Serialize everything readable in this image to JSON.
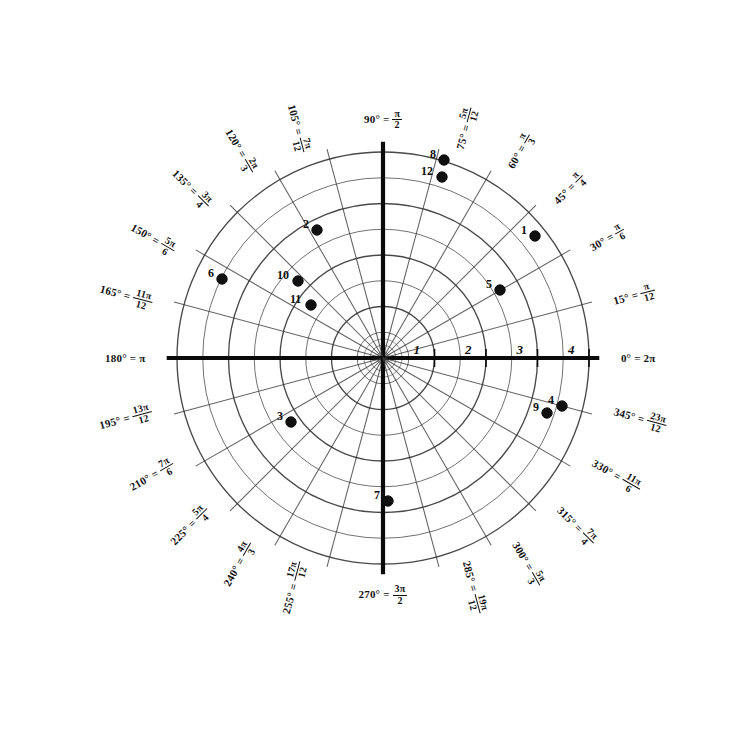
{
  "chart_data": {
    "type": "scatter",
    "title": "",
    "subtitle": "",
    "coordinate_system": "polar",
    "xlabel": "",
    "ylabel": "",
    "grid": true,
    "legend": "none",
    "center_px": [
      383,
      358
    ],
    "pixels_per_unit": 51.5,
    "radial_ticks": [
      "1",
      "2",
      "3",
      "4"
    ],
    "radial_tick_values": [
      1,
      2,
      3,
      4
    ],
    "radial_minor_rings": [
      0.5,
      1.5,
      2.5,
      3.5
    ],
    "rlim": [
      0,
      4.2
    ],
    "angular_step_deg": 15,
    "angular_labels": [
      {
        "deg": "0°",
        "rad_num": "",
        "rad_den": "",
        "rad_plain": "2π",
        "angle": 0,
        "rot": 0
      },
      {
        "deg": "15°",
        "rad_num": "π",
        "rad_den": "12",
        "rad_plain": "",
        "angle": 15,
        "rot": -15
      },
      {
        "deg": "30°",
        "rad_num": "π",
        "rad_den": "6",
        "rad_plain": "",
        "angle": 30,
        "rot": -30
      },
      {
        "deg": "45°",
        "rad_num": "π",
        "rad_den": "4",
        "rad_plain": "",
        "angle": 45,
        "rot": -45
      },
      {
        "deg": "60°",
        "rad_num": "π",
        "rad_den": "3",
        "rad_plain": "",
        "angle": 60,
        "rot": -60
      },
      {
        "deg": "75°",
        "rad_num": "5π",
        "rad_den": "12",
        "rad_plain": "",
        "angle": 75,
        "rot": -75
      },
      {
        "deg": "90°",
        "rad_num": "π",
        "rad_den": "2",
        "rad_plain": "",
        "angle": 90,
        "rot": 0
      },
      {
        "deg": "105°",
        "rad_num": "7π",
        "rad_den": "12",
        "rad_plain": "",
        "angle": 105,
        "rot": 75
      },
      {
        "deg": "120°",
        "rad_num": "2π",
        "rad_den": "3",
        "rad_plain": "",
        "angle": 120,
        "rot": 60
      },
      {
        "deg": "135°",
        "rad_num": "3π",
        "rad_den": "4",
        "rad_plain": "",
        "angle": 135,
        "rot": 45
      },
      {
        "deg": "150°",
        "rad_num": "5π",
        "rad_den": "6",
        "rad_plain": "",
        "angle": 150,
        "rot": 30
      },
      {
        "deg": "165°",
        "rad_num": "11π",
        "rad_den": "12",
        "rad_plain": "",
        "angle": 165,
        "rot": 15
      },
      {
        "deg": "180°",
        "rad_num": "",
        "rad_den": "",
        "rad_plain": "π",
        "angle": 180,
        "rot": 0
      },
      {
        "deg": "195°",
        "rad_num": "13π",
        "rad_den": "12",
        "rad_plain": "",
        "angle": 195,
        "rot": -15
      },
      {
        "deg": "210°",
        "rad_num": "7π",
        "rad_den": "6",
        "rad_plain": "",
        "angle": 210,
        "rot": -30
      },
      {
        "deg": "225°",
        "rad_num": "5π",
        "rad_den": "4",
        "rad_plain": "",
        "angle": 225,
        "rot": -45
      },
      {
        "deg": "240°",
        "rad_num": "4π",
        "rad_den": "3",
        "rad_plain": "",
        "angle": 240,
        "rot": -60
      },
      {
        "deg": "255°",
        "rad_num": "17π",
        "rad_den": "12",
        "rad_plain": "",
        "angle": 255,
        "rot": -75
      },
      {
        "deg": "270°",
        "rad_num": "3π",
        "rad_den": "2",
        "rad_plain": "",
        "angle": 270,
        "rot": 0
      },
      {
        "deg": "285°",
        "rad_num": "19π",
        "rad_den": "12",
        "rad_plain": "",
        "angle": 285,
        "rot": 75
      },
      {
        "deg": "300°",
        "rad_num": "5π",
        "rad_den": "3",
        "rad_plain": "",
        "angle": 300,
        "rot": 60
      },
      {
        "deg": "315°",
        "rad_num": "7π",
        "rad_den": "4",
        "rad_plain": "",
        "angle": 315,
        "rot": 45
      },
      {
        "deg": "330°",
        "rad_num": "11π",
        "rad_den": "6",
        "rad_plain": "",
        "angle": 330,
        "rot": 30
      },
      {
        "deg": "345°",
        "rad_num": "23π",
        "rad_den": "12",
        "rad_plain": "",
        "angle": 345,
        "rot": 15
      }
    ],
    "points": [
      {
        "label": "1",
        "px": [
          535,
          236
        ],
        "r": 2.9,
        "theta_deg": 32
      },
      {
        "label": "2",
        "px": [
          317,
          230
        ],
        "r": 2.6,
        "theta_deg": 126
      },
      {
        "label": "3",
        "px": [
          291,
          422
        ],
        "r": 2.1,
        "theta_deg": 212
      },
      {
        "label": "4",
        "px": [
          562,
          406
        ],
        "r": 3.6,
        "theta_deg": 345
      },
      {
        "label": "5",
        "px": [
          500,
          290
        ],
        "r": 2.5,
        "theta_deg": 21
      },
      {
        "label": "6",
        "px": [
          222,
          279
        ],
        "r": 3.3,
        "theta_deg": 151
      },
      {
        "label": "7",
        "px": [
          388,
          501
        ],
        "r": 2.8,
        "theta_deg": 270
      },
      {
        "label": "8",
        "px": [
          444,
          160
        ],
        "r": 4.0,
        "theta_deg": 73
      },
      {
        "label": "9",
        "px": [
          547,
          413
        ],
        "r": 3.4,
        "theta_deg": 342
      },
      {
        "label": "10",
        "px": [
          298,
          281
        ],
        "r": 1.9,
        "theta_deg": 134
      },
      {
        "label": "11",
        "px": [
          311,
          305
        ],
        "r": 1.4,
        "theta_deg": 141
      },
      {
        "label": "12",
        "px": [
          442,
          177
        ],
        "r": 3.7,
        "theta_deg": 75
      }
    ]
  },
  "style": {
    "grid_color": "#3a3a3a",
    "axis_color": "#0a0a0a",
    "point_color": "#101010",
    "background": "#ffffff"
  }
}
